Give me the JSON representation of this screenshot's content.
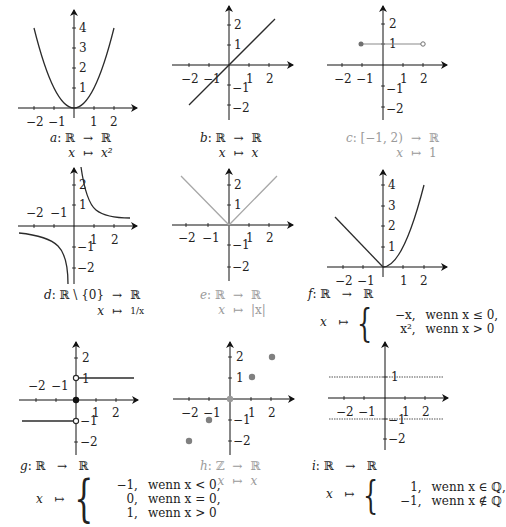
{
  "panels": [
    {
      "id": "a",
      "name": "a",
      "domain": "ℝ",
      "codomain": "ℝ",
      "var": "x",
      "rule": "x²",
      "style": "dark",
      "x_ticks": [
        "−2",
        "−1",
        "1",
        "2"
      ],
      "y_ticks": [
        "1",
        "2",
        "3",
        "4"
      ]
    },
    {
      "id": "b",
      "name": "b",
      "domain": "ℝ",
      "codomain": "ℝ",
      "var": "x",
      "rule": "x",
      "style": "dark",
      "x_ticks": [
        "−2",
        "−1",
        "1",
        "2"
      ],
      "y_ticks": [
        "2",
        "1",
        "−1",
        "−2"
      ]
    },
    {
      "id": "c",
      "name": "c",
      "domain": "[−1, 2)",
      "codomain": "ℝ",
      "var": "x",
      "rule": "1",
      "style": "faded",
      "x_ticks": [
        "−2",
        "−1",
        "1",
        "2"
      ],
      "y_ticks": [
        "2",
        "1",
        "−1",
        "−2"
      ]
    },
    {
      "id": "d",
      "name": "d",
      "domain": "ℝ \\ {0}",
      "codomain": "ℝ",
      "var": "x",
      "rule": "1/x",
      "style": "dark",
      "x_ticks": [
        "−2",
        "−1",
        "1",
        "2"
      ],
      "y_ticks": [
        "2",
        "1",
        "−1",
        "−2"
      ]
    },
    {
      "id": "e",
      "name": "e",
      "domain": "ℝ",
      "codomain": "ℝ",
      "var": "x",
      "rule": "|x|",
      "style": "faded",
      "x_ticks": [
        "−2",
        "−1",
        "1",
        "2"
      ],
      "y_ticks": [
        "2",
        "1",
        "−1",
        "−2"
      ]
    },
    {
      "id": "f",
      "name": "f",
      "domain": "ℝ",
      "codomain": "ℝ",
      "var": "x",
      "style": "dark",
      "cases": [
        {
          "val": "−x,",
          "cond": "wenn x ≤ 0,"
        },
        {
          "val": "x²,",
          "cond": "wenn x > 0"
        }
      ],
      "x_ticks": [
        "−2",
        "−1",
        "1",
        "2"
      ],
      "y_ticks": [
        "1",
        "2",
        "3",
        "4"
      ]
    },
    {
      "id": "g",
      "name": "g",
      "domain": "ℝ",
      "codomain": "ℝ",
      "var": "x",
      "style": "dark",
      "cases": [
        {
          "val": "−1,",
          "cond": "wenn x < 0,"
        },
        {
          "val": "0,",
          "cond": "wenn x = 0,"
        },
        {
          "val": "1,",
          "cond": "wenn x > 0"
        }
      ],
      "x_ticks": [
        "−2",
        "−1",
        "1",
        "2"
      ],
      "y_ticks": [
        "2",
        "1",
        "−1",
        "−2"
      ]
    },
    {
      "id": "h",
      "name": "h",
      "domain": "ℤ",
      "codomain": "ℝ",
      "var": "x",
      "rule": "x",
      "style": "faded",
      "x_ticks": [
        "−2",
        "−1",
        "1",
        "2"
      ],
      "y_ticks": [
        "2",
        "1",
        "−1",
        "−2"
      ]
    },
    {
      "id": "i",
      "name": "i",
      "domain": "ℝ",
      "codomain": "ℝ",
      "var": "x",
      "style": "dark",
      "cases": [
        {
          "val": "1,",
          "cond": "wenn x ∈ ℚ,"
        },
        {
          "val": "−1,",
          "cond": "wenn x ∉ ℚ"
        }
      ],
      "x_ticks": [
        "−2",
        "−1",
        "1",
        "2"
      ],
      "y_ticks": [
        "1",
        "−1",
        "−2"
      ]
    }
  ],
  "symbols": {
    "maps_to_set": "→",
    "maps_to_elem": "↦",
    "colon": ":"
  },
  "colors": {
    "dark": "#2b2b2b",
    "faded": "#9a9a9a",
    "point": "#707070"
  }
}
